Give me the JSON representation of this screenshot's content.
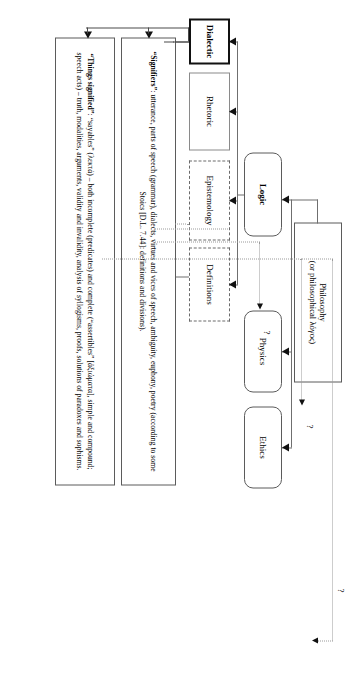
{
  "diagram": {
    "orientation": "rotated-90-clockwise",
    "nodes": {
      "philosophy": "Philosophy\n(or philosophical λόγος)",
      "philosophy_line1": "Philosophy",
      "philosophy_line2": "(or philosophical λόγος)",
      "logic": "Logic",
      "physics": "Physics",
      "ethics": "Ethics",
      "rhetoric": "Rhetoric",
      "dialectic": "Dialectic",
      "epistemology": "Epistemology",
      "definitions": "Definitions"
    },
    "detail_boxes": {
      "signifiers": {
        "lead": "“Signifiers”",
        "text": "“Signifiers”: utterance, parts of speech (grammar), dialects, virtues and vices of speech, ambiguity, euphony, poetry (according to some Stoics [D.L. 7.44]: definitions and divisions)."
      },
      "things_signified": {
        "lead": "“Things signified”",
        "text": "“Things signified”: “sayables” (λεκτά) – both incomplete (predicates) and complete (“assertibles” [ἀξιώματα], simple and compound; speech acts) – truth, modalities, arguments, validity and invalidity, analysis of syllogisms, proofs, solutions of paradoxes and sophisms."
      }
    },
    "annotations": {
      "q_physics": "?",
      "q_ethics": "?",
      "q_top": "?"
    },
    "colors": {
      "ink": "#000000",
      "line": "#6f6f6f",
      "dotted": "#9a9a9a",
      "heavy_border": "#111111",
      "background": "#ffffff"
    }
  }
}
